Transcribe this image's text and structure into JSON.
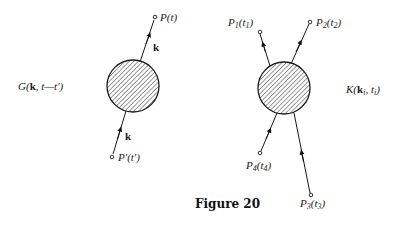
{
  "diagrams": [
    {
      "name": "two-point",
      "label": {
        "func": "G",
        "open": "(",
        "k": "k",
        "rest": ", t—t′)"
      },
      "circle": {
        "cx": 133,
        "cy": 86,
        "r": 26,
        "hatched": true
      },
      "lines": [
        {
          "from": [
            144,
            61
          ],
          "to": [
            155,
            17
          ],
          "arrow": "out",
          "arrow_at": [
            148,
            45
          ],
          "momentum_label": "k",
          "endpoint_label": {
            "name": "P",
            "arg": "t",
            "prime": false
          }
        },
        {
          "from": [
            112,
            157
          ],
          "to": [
            125,
            112
          ],
          "arrow": "in",
          "arrow_at": [
            119,
            134
          ],
          "momentum_label": "k",
          "endpoint_label": {
            "name": "P′",
            "arg": "t′",
            "prime": true
          }
        }
      ]
    },
    {
      "name": "four-point",
      "label": {
        "func": "K",
        "open": "(",
        "k": "k",
        "k_sub": "i",
        "sep": ", t",
        "t_sub": "i",
        "close": ")"
      },
      "circle": {
        "cx": 284,
        "cy": 88,
        "r": 26,
        "hatched": true
      },
      "lines": [
        {
          "endpoint": "P1",
          "label": "P",
          "sub": "1",
          "arg": "t",
          "arg_sub": "1"
        },
        {
          "endpoint": "P2",
          "label": "P",
          "sub": "2",
          "arg": "t",
          "arg_sub": "2"
        },
        {
          "endpoint": "P3",
          "label": "P",
          "sub": "3",
          "arg": "t",
          "arg_sub": "3"
        },
        {
          "endpoint": "P4",
          "label": "P",
          "sub": "4",
          "arg": "t",
          "arg_sub": "4"
        }
      ]
    }
  ],
  "caption": "Figure 20",
  "colors": {
    "ink": "#1a1a1a",
    "background": "#ffffff"
  }
}
